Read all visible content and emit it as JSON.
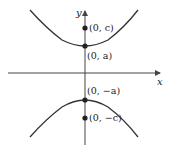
{
  "figure": {
    "type": "hyperbola-vertical",
    "axes": {
      "x_label": "x",
      "y_label": "y"
    },
    "points": [
      {
        "id": "focus-top",
        "label": "(0, c)",
        "var": "c",
        "sign": ""
      },
      {
        "id": "vertex-top",
        "label": "(0, a)",
        "var": "a",
        "sign": ""
      },
      {
        "id": "vertex-bottom",
        "label": "(0, −a)",
        "var": "a",
        "sign": "−"
      },
      {
        "id": "focus-bottom",
        "label": "(0, −c)",
        "var": "c",
        "sign": "−"
      }
    ],
    "colors": {
      "curve": "#333333",
      "axis": "#444444",
      "point": "#222222"
    }
  }
}
